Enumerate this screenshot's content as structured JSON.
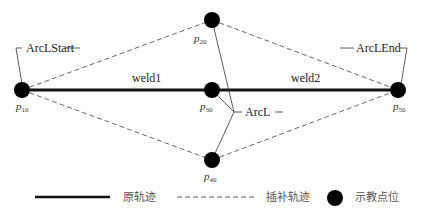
{
  "diagram": {
    "points": [
      {
        "id": "p10",
        "base": "p",
        "sub": "10",
        "x": 22,
        "y": 90
      },
      {
        "id": "p20",
        "base": "p",
        "sub": "20",
        "x": 212,
        "y": 20
      },
      {
        "id": "p30",
        "base": "p",
        "sub": "30",
        "x": 212,
        "y": 90
      },
      {
        "id": "p40",
        "base": "p",
        "sub": "40",
        "x": 212,
        "y": 160
      },
      {
        "id": "p50",
        "base": "p",
        "sub": "50",
        "x": 398,
        "y": 90
      }
    ],
    "segments": {
      "weld1": "weld1",
      "weld2": "weld2"
    },
    "annotations": {
      "arc_start": "ArcLStart",
      "arc_end": "ArcLEnd",
      "arc": "ArcL"
    },
    "colors": {
      "solid": "#111111",
      "dashed": "#666666",
      "point": "#000000"
    }
  },
  "legend": {
    "items": [
      {
        "label": "原轨迹",
        "type": "solid-line"
      },
      {
        "label": "插补轨迹",
        "type": "dashed-line"
      },
      {
        "label": "示教点位",
        "type": "point"
      }
    ]
  }
}
